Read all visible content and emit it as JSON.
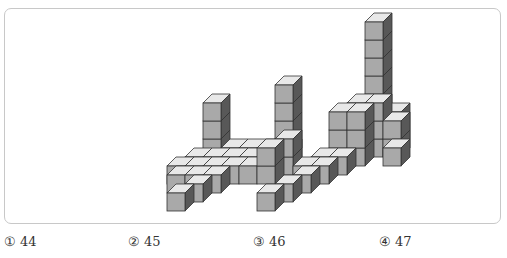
{
  "figure": {
    "colors": {
      "top": "#e8e8e8",
      "front": "#a9a9a9",
      "side": "#585858",
      "edge": "#333333"
    }
  },
  "choices": [
    {
      "marker": "①",
      "value": "44"
    },
    {
      "marker": "②",
      "value": "45"
    },
    {
      "marker": "③",
      "value": "46"
    },
    {
      "marker": "④",
      "value": "47"
    }
  ]
}
